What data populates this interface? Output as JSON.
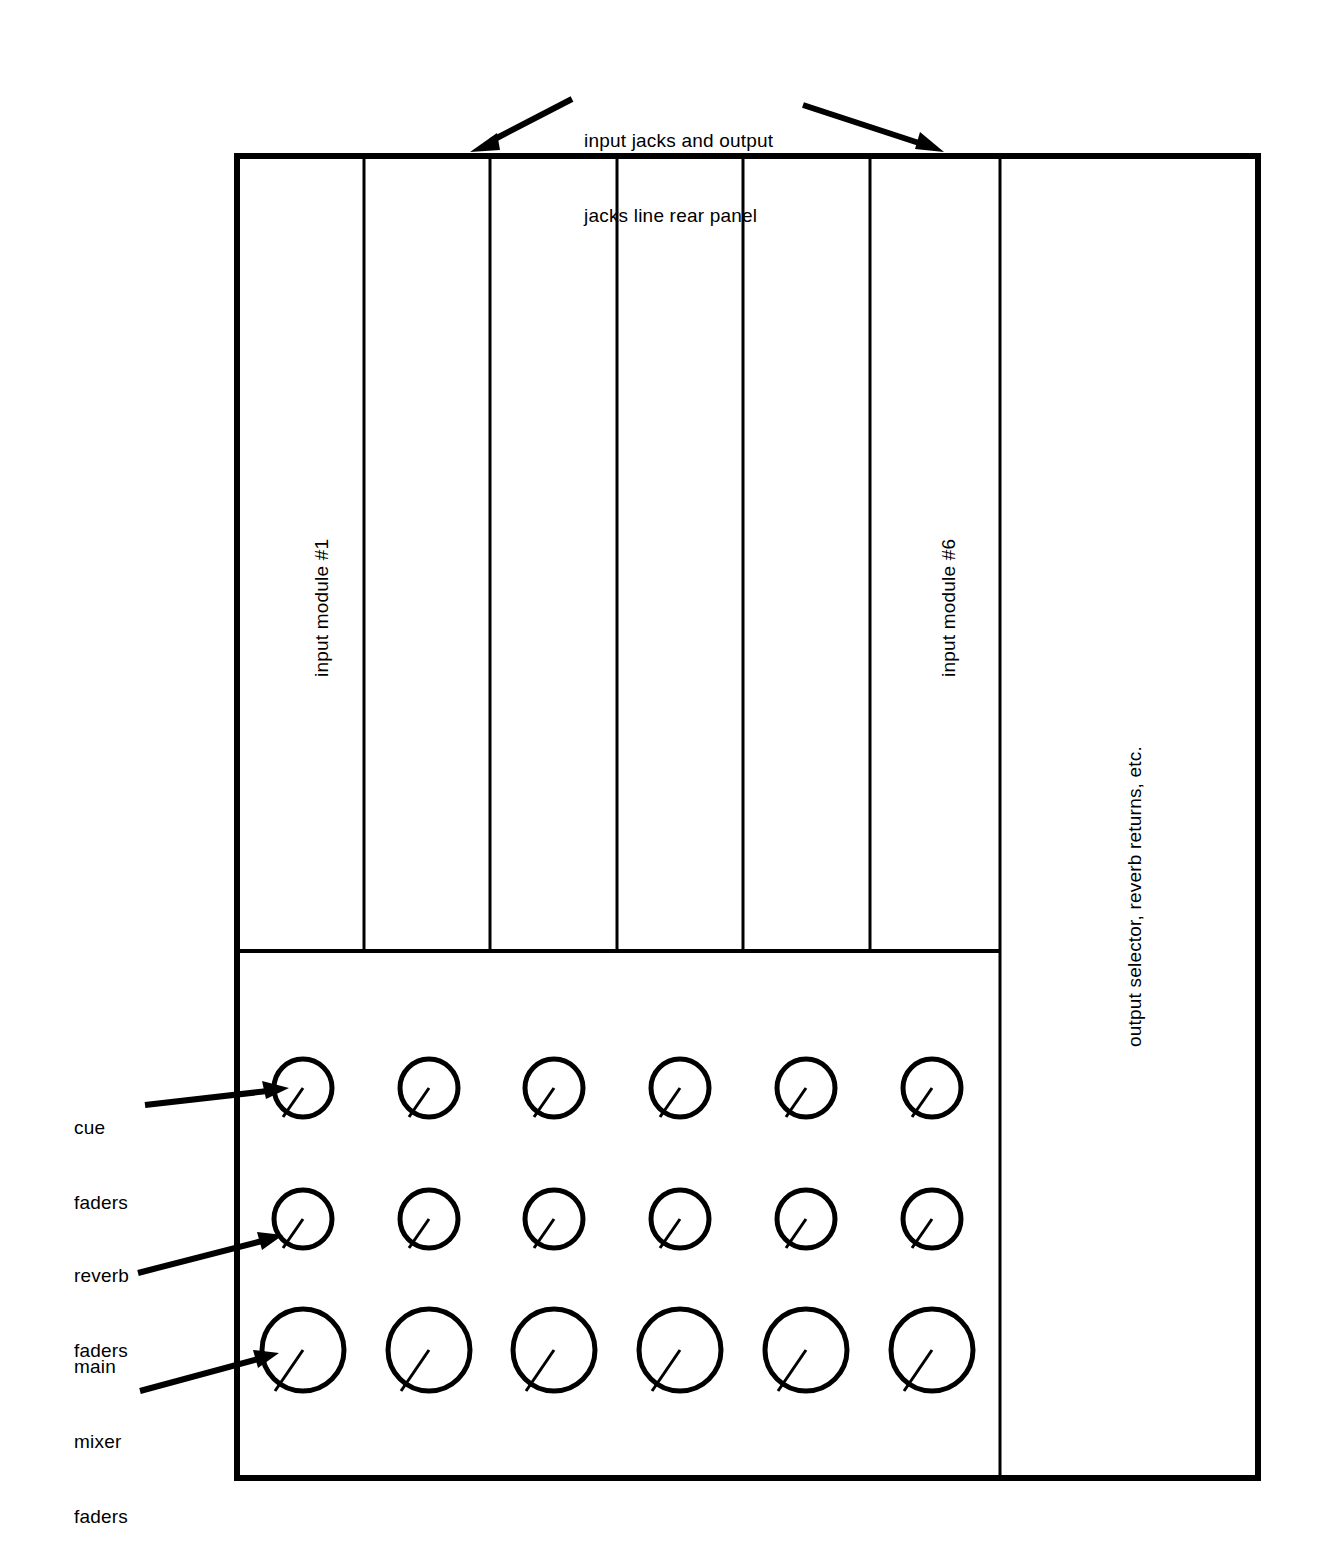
{
  "diagram": {
    "annotations": {
      "top": {
        "line1": "input jacks and output",
        "line2": "jacks line rear panel"
      },
      "cue_faders": {
        "line1": "cue",
        "line2": "faders"
      },
      "reverb_faders": {
        "line1": "reverb",
        "line2": "faders"
      },
      "main_mixer_faders": {
        "line1": "main",
        "line2": "mixer",
        "line3": "faders"
      }
    },
    "module_labels": {
      "first": "input module #1",
      "last": "input module #6"
    },
    "output_section_label": "output selector, reverb returns, etc.",
    "colors": {
      "ink": "#000000",
      "paper": "#ffffff"
    },
    "counts": {
      "input_modules": 6,
      "fader_rows": 3,
      "knobs_per_row": 6
    },
    "fader_rows": [
      {
        "name": "cue faders",
        "knob_diameter": 58
      },
      {
        "name": "reverb faders",
        "knob_diameter": 58
      },
      {
        "name": "main mixer faders",
        "knob_diameter": 82
      }
    ]
  }
}
